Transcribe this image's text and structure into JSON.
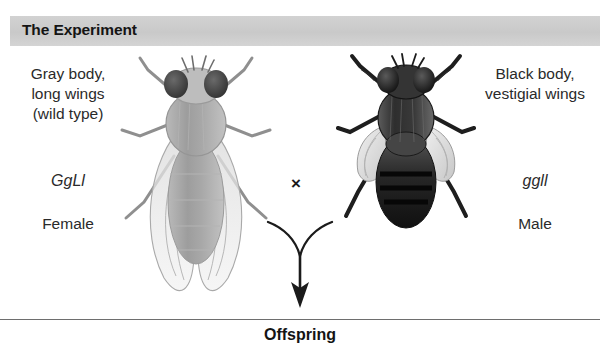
{
  "header": {
    "title": "The Experiment",
    "band_color": "#cfcfcf"
  },
  "parents": {
    "female": {
      "phenotype_line1": "Gray body,",
      "phenotype_line2": "long wings",
      "phenotype_line3": "(wild type)",
      "genotype": "GgLl",
      "sex": "Female",
      "fly_name": "wild-type-fly-illustration",
      "body_color": "#9a9a9a",
      "wing_type": "long"
    },
    "male": {
      "phenotype_line1": "Black body,",
      "phenotype_line2": "vestigial wings",
      "phenotype_line3": "",
      "genotype": "ggll",
      "sex": "Male",
      "fly_name": "vestigial-mutant-fly-illustration",
      "body_color": "#242424",
      "wing_type": "vestigial"
    }
  },
  "cross": {
    "symbol": "×"
  },
  "arrow": {
    "name": "y-shaped-cross-arrow",
    "color": "#1b1b1b"
  },
  "footer": {
    "label": "Offspring"
  }
}
